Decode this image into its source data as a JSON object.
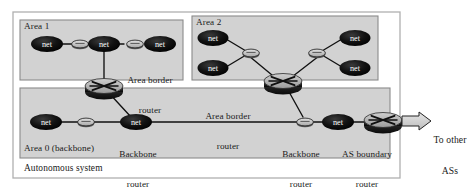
{
  "diagram": {
    "outer_frame": {
      "label": "Autonomous system"
    },
    "colors": {
      "area_fill": "#d2d2d2",
      "area_stroke": "#8a8a8a",
      "frame_stroke": "#aaaaaa",
      "net_fill": "#0d0d0d",
      "net_text": "#ffffff",
      "link_router_fill": "#c9c9c9",
      "link_router_stroke": "#2a2a2a",
      "router_top": "#b9b9b9",
      "router_body": "#1d1d1d",
      "line": "#111111",
      "arrow_fill": "#d8d8d8",
      "arrow_stroke": "#222222",
      "text": "#1a1a1a"
    },
    "areas": [
      {
        "id": "area1",
        "label": "Area 1"
      },
      {
        "id": "area2",
        "label": "Area 2"
      },
      {
        "id": "area0",
        "label": "Area 0 (backbone)"
      }
    ],
    "net_nodes": [
      {
        "id": "a1-net-left",
        "label": "net",
        "area": "area1"
      },
      {
        "id": "a1-net-mid",
        "label": "net",
        "area": "area1"
      },
      {
        "id": "a1-net-right",
        "label": "net",
        "area": "area1"
      },
      {
        "id": "a2-net-tl",
        "label": "net",
        "area": "area2"
      },
      {
        "id": "a2-net-bl",
        "label": "net",
        "area": "area2"
      },
      {
        "id": "a2-net-tr",
        "label": "net",
        "area": "area2"
      },
      {
        "id": "a2-net-br",
        "label": "net",
        "area": "area2"
      },
      {
        "id": "a0-net-left",
        "label": "net",
        "area": "area0"
      },
      {
        "id": "a0-net-mid",
        "label": "net",
        "area": "area0"
      },
      {
        "id": "a0-net-right",
        "label": "net",
        "area": "area0"
      }
    ],
    "captions": [
      {
        "id": "area-border-router-left",
        "line1": "Area border",
        "line2": "router"
      },
      {
        "id": "area-border-router-right",
        "line1": "Area border",
        "line2": "router"
      },
      {
        "id": "backbone-router-left",
        "line1": "Backbone",
        "line2": "router"
      },
      {
        "id": "backbone-router-right",
        "line1": "Backbone",
        "line2": "router"
      },
      {
        "id": "as-boundary-router",
        "line1": "AS boundary",
        "line2": "router"
      }
    ],
    "external": {
      "line1": "To other",
      "line2": "ASs"
    }
  }
}
